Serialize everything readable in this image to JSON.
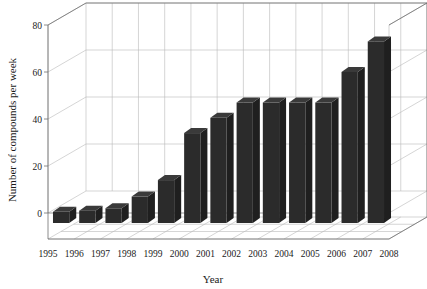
{
  "chart_data": {
    "type": "bar",
    "title": "",
    "subtitle": "",
    "xlabel": "Year",
    "ylabel": "Number of compounds per week",
    "categories": [
      "1995",
      "1996",
      "1997",
      "1998",
      "1999",
      "2000",
      "2001",
      "2002",
      "2003",
      "2004",
      "2005",
      "2006",
      "2007"
    ],
    "values": [
      0.5,
      1,
      2,
      7,
      14,
      34,
      40.5,
      47,
      47,
      47,
      47,
      60,
      73
    ],
    "xtick_labels": [
      "1995",
      "1996",
      "1997",
      "1998",
      "1999",
      "2000",
      "2001",
      "2002",
      "2003",
      "2004",
      "2005",
      "2006",
      "2007",
      "2008"
    ],
    "ytick_labels": [
      "0",
      "20",
      "40",
      "60",
      "80"
    ],
    "ytick_values": [
      0,
      20,
      40,
      60,
      80
    ],
    "ylim": [
      0,
      80
    ],
    "grid": true,
    "legend": false,
    "legend_position": "none",
    "projection": "3d",
    "bar_color": "#2b2b2b",
    "bar_top_color": "#3a3a3a",
    "bar_side_color": "#1f1f1f",
    "grid_color": "#b9b9b9",
    "axis_color": "#6e6e6e",
    "background_color": "#ffffff",
    "annotations": []
  },
  "axes": {
    "x_axis_label": "Year",
    "y_axis_label": "Number of compounds per week"
  }
}
